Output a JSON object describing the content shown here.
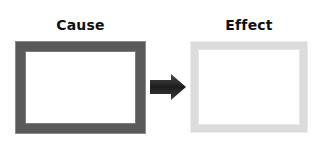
{
  "diagram": {
    "cause": {
      "label": "Cause",
      "border_color": "#5a5a5a"
    },
    "effect": {
      "label": "Effect",
      "border_color": "#dcdcdc"
    },
    "arrow": {
      "icon": "right-arrow-icon",
      "color": "#2a2a2a",
      "direction": "right"
    }
  }
}
